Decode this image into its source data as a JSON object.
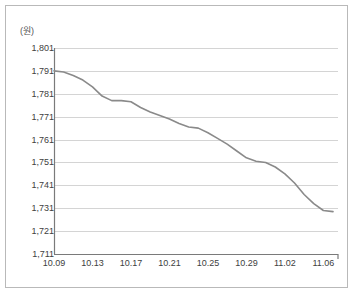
{
  "chart_data": {
    "type": "line",
    "title": "",
    "subtitle": "",
    "xlabel": "",
    "ylabel": "",
    "unit_label": "(원)",
    "grid": true,
    "legend": null,
    "ylim": [
      1711,
      1801
    ],
    "ytick_labels": [
      "1,801",
      "1,791",
      "1,781",
      "1,771",
      "1,761",
      "1,751",
      "1,741",
      "1,731",
      "1,721",
      "1,711"
    ],
    "ytick_values": [
      1801,
      1791,
      1781,
      1771,
      1761,
      1751,
      1741,
      1731,
      1721,
      1711
    ],
    "xtick_labels": [
      "10.09",
      "10.13",
      "10.17",
      "10.21",
      "10.25",
      "10.29",
      "11.02",
      "11.06"
    ],
    "xtick_indices": [
      0,
      4,
      8,
      12,
      16,
      20,
      24,
      28
    ],
    "line_color": "#8a8a8a",
    "grid_color": "#d4d4d4",
    "axis_color": "#7a7a7a",
    "x": [
      "10.09",
      "10.10",
      "10.11",
      "10.12",
      "10.13",
      "10.14",
      "10.15",
      "10.16",
      "10.17",
      "10.18",
      "10.19",
      "10.20",
      "10.21",
      "10.22",
      "10.23",
      "10.24",
      "10.25",
      "10.26",
      "10.27",
      "10.28",
      "10.29",
      "10.30",
      "10.31",
      "11.01",
      "11.02",
      "11.03",
      "11.04",
      "11.05",
      "11.06",
      "11.07"
    ],
    "values": [
      1791,
      1790.5,
      1789,
      1787,
      1784,
      1780,
      1778,
      1778,
      1777.5,
      1775,
      1773,
      1771.5,
      1770,
      1768,
      1766.5,
      1766,
      1764,
      1761.5,
      1759,
      1756,
      1753,
      1751.5,
      1751,
      1749,
      1746,
      1742,
      1737,
      1733,
      1730,
      1729.5
    ]
  }
}
